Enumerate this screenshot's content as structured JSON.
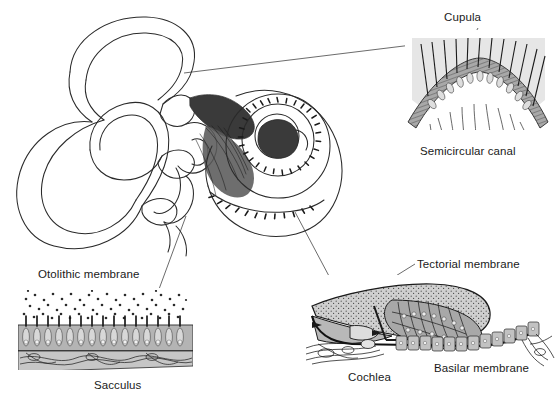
{
  "figure": {
    "background_color": "#ffffff",
    "ink_color": "#1a1a1a",
    "labels": {
      "cupula": "Cupula",
      "semicircular_canal": "Semicircular canal",
      "otolithic_membrane": "Otolithic membrane",
      "sacculus": "Sacculus",
      "tectorial_membrane": "Tectorial membrane",
      "cochlea": "Cochlea",
      "basilar_membrane": "Basilar membrane"
    },
    "panels": {
      "main": {
        "name": "bony labyrinth and cochlea overview",
        "contents": "three semicircular canals, vestibule, spiral cochlea with hair cell row"
      },
      "semicircular_canal_inset": {
        "name": "crista ampullaris inset",
        "cupula_color": "#e8e8e8",
        "epithelium_color": "#9a9a9a"
      },
      "sacculus_inset": {
        "name": "macula of the sacculus inset",
        "otoconia_color": "#2a2a2a",
        "epithelium_color": "#b0b0b0"
      },
      "cochlea_inset": {
        "name": "organ of Corti inset",
        "tectorial_color": "#c9c9c9",
        "epithelium_color": "#a8a8a8"
      }
    }
  }
}
